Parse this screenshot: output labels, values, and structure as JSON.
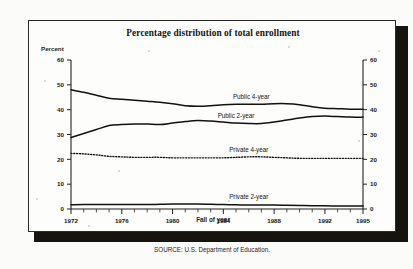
{
  "figure": {
    "title": "Percentage distribution of total enrollment",
    "source": "SOURCE: U.S. Department of Education.",
    "y_axis_title": "Percent",
    "x_axis_title": "Fall of year"
  },
  "chart_data": {
    "type": "line",
    "title": "Percentage distribution of total enrollment",
    "xlabel": "Fall of year",
    "ylabel": "Percent",
    "xlim": [
      1972,
      1995
    ],
    "ylim": [
      0,
      60
    ],
    "ytick_labels": [
      "0",
      "10",
      "20",
      "30",
      "40",
      "50",
      "60"
    ],
    "yticks": [
      0,
      10,
      20,
      30,
      40,
      50,
      60
    ],
    "xtick_labels": [
      "1972",
      "1976",
      "1980",
      "1984",
      "1988",
      "1992",
      "1995"
    ],
    "xticks_major": [
      1972,
      1976,
      1980,
      1984,
      1988,
      1992,
      1995
    ],
    "minor_ticks_every": 1,
    "grid": false,
    "dual_y_axis": true,
    "legend": "inline-labels",
    "x": [
      1972,
      1973,
      1974,
      1975,
      1976,
      1977,
      1978,
      1979,
      1980,
      1981,
      1982,
      1983,
      1984,
      1985,
      1986,
      1987,
      1988,
      1989,
      1990,
      1991,
      1992,
      1993,
      1994,
      1995
    ],
    "series": [
      {
        "name": "Public 4-year",
        "label": "Public 4-year",
        "style": "solid",
        "color": "#111110",
        "values": [
          48.0,
          47.0,
          45.8,
          44.6,
          44.2,
          43.8,
          43.4,
          43.0,
          42.4,
          41.6,
          41.4,
          41.6,
          42.0,
          42.2,
          42.2,
          42.2,
          42.4,
          42.4,
          42.0,
          41.2,
          40.6,
          40.4,
          40.2,
          40.2
        ]
      },
      {
        "name": "Public 2-year",
        "label": "Public 2-year",
        "style": "solid",
        "color": "#111110",
        "values": [
          28.8,
          30.4,
          32.0,
          33.6,
          34.0,
          34.2,
          34.2,
          34.0,
          34.6,
          35.2,
          35.6,
          35.4,
          35.0,
          34.6,
          34.4,
          34.4,
          35.0,
          35.8,
          36.6,
          37.2,
          37.4,
          37.2,
          37.0,
          37.0
        ]
      },
      {
        "name": "Private 4-year",
        "label": "Private 4-year",
        "style": "dotted",
        "color": "#141414",
        "values": [
          22.4,
          22.2,
          21.8,
          21.2,
          21.0,
          20.8,
          20.8,
          20.8,
          20.6,
          20.6,
          20.6,
          20.6,
          20.6,
          20.8,
          21.0,
          21.0,
          20.8,
          20.6,
          20.4,
          20.4,
          20.4,
          20.4,
          20.4,
          20.4
        ]
      },
      {
        "name": "Private 2-year",
        "label": "Private 2-year",
        "style": "solid",
        "color": "#111110",
        "values": [
          1.7,
          1.8,
          1.8,
          1.8,
          1.8,
          1.8,
          1.8,
          1.9,
          2.0,
          2.0,
          2.0,
          1.9,
          1.8,
          1.7,
          1.6,
          1.6,
          1.6,
          1.5,
          1.4,
          1.3,
          1.3,
          1.2,
          1.2,
          1.2
        ]
      }
    ]
  }
}
